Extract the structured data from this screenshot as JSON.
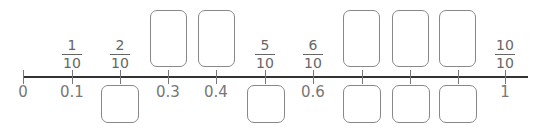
{
  "number_line": {
    "start": "0",
    "end": "1",
    "decimal_labels": [
      "0",
      "0.1",
      "0.3",
      "0.4",
      "0.6",
      "1"
    ],
    "fraction_labels": [
      {
        "num": "1",
        "den": "10"
      },
      {
        "num": "2",
        "den": "10"
      },
      {
        "num": "5",
        "den": "10"
      },
      {
        "num": "6",
        "den": "10"
      },
      {
        "num": "10",
        "den": "10"
      }
    ],
    "blank_boxes_above": [
      "0.3",
      "0.4",
      "0.7",
      "0.8",
      "0.9"
    ],
    "blank_boxes_below": [
      "2/10",
      "5/10",
      "0.7",
      "0.8",
      "0.9"
    ]
  }
}
